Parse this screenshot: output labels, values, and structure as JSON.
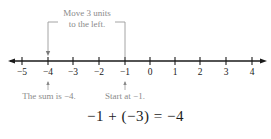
{
  "diagram": {
    "type": "number-line",
    "ticks": [
      "−5",
      "−4",
      "−3",
      "−2",
      "−1",
      "0",
      "1",
      "2",
      "3",
      "4"
    ],
    "tick_values": [
      -5,
      -4,
      -3,
      -2,
      -1,
      0,
      1,
      2,
      3,
      4
    ],
    "bracket_label_line1": "Move 3 units",
    "bracket_label_line2": "to the left.",
    "annotation_sum": "The sum is −4.",
    "annotation_start": "Start at −1.",
    "equation": "−1 + (−3) = −4",
    "colors": {
      "axis": "#1a1a1a",
      "annotation": "#8a8a8a",
      "bracket": "#9a9a9a"
    }
  }
}
